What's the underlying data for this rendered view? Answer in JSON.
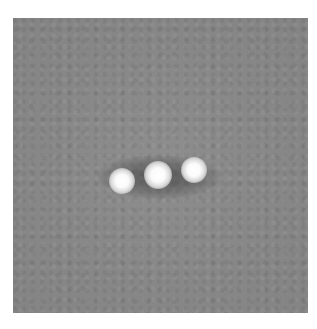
{
  "image": {
    "description": "Grayscale micrograph with three bright spots on a mid-gray background",
    "background_color": "#888888",
    "frame": {
      "x": 13,
      "y": 18,
      "width": 295,
      "height": 295
    },
    "spots": [
      {
        "name": "left-spot",
        "cx": 109,
        "cy": 163,
        "r": 11,
        "halo": false
      },
      {
        "name": "center-spot",
        "cx": 145,
        "cy": 157,
        "r": 12,
        "halo": true
      },
      {
        "name": "right-spot",
        "cx": 181,
        "cy": 152,
        "r": 11,
        "halo": false
      }
    ],
    "halo": {
      "cx": 146,
      "cy": 159,
      "rx": 62,
      "ry": 22
    }
  }
}
